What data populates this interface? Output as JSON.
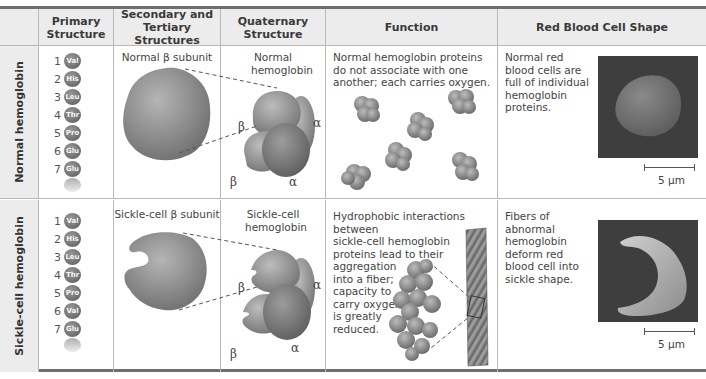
{
  "header": {
    "columns": [
      {
        "id": "row_label",
        "label": ""
      },
      {
        "id": "primary",
        "label": "Primary Structure"
      },
      {
        "id": "secondary_tertiary",
        "label": "Secondary and Tertiary Structures"
      },
      {
        "id": "quaternary",
        "label": "Quaternary Structure"
      },
      {
        "id": "function",
        "label": "Function"
      },
      {
        "id": "rbc_shape",
        "label": "Red Blood Cell Shape"
      }
    ]
  },
  "rows": [
    {
      "label": "Normal hemoglobin",
      "primary": {
        "residues": [
          {
            "n": "1",
            "aa": "Val"
          },
          {
            "n": "2",
            "aa": "His"
          },
          {
            "n": "3",
            "aa": "Leu"
          },
          {
            "n": "4",
            "aa": "Thr"
          },
          {
            "n": "5",
            "aa": "Pro"
          },
          {
            "n": "6",
            "aa": "Glu"
          },
          {
            "n": "7",
            "aa": "Glu"
          }
        ]
      },
      "secondary_caption": "Normal β subunit",
      "quaternary_caption": "Normal hemoglobin",
      "quaternary_labels": {
        "beta_top": "β",
        "alpha_right": "α",
        "beta_bottom": "β",
        "alpha_bottom": "α"
      },
      "function_text": "Normal hemoglobin proteins do not associate with one another; each carries oxygen.",
      "rbc_text": "Normal red blood cells are full of individual hemoglobin proteins.",
      "scale_label": "5 µm"
    },
    {
      "label": "Sickle-cell hemoglobin",
      "primary": {
        "residues": [
          {
            "n": "1",
            "aa": "Val"
          },
          {
            "n": "2",
            "aa": "His"
          },
          {
            "n": "3",
            "aa": "Leu"
          },
          {
            "n": "4",
            "aa": "Thr"
          },
          {
            "n": "5",
            "aa": "Pro"
          },
          {
            "n": "6",
            "aa": "Val"
          },
          {
            "n": "7",
            "aa": "Glu"
          }
        ]
      },
      "secondary_caption": "Sickle-cell β subunit",
      "quaternary_caption": "Sickle-cell hemoglobin",
      "quaternary_labels": {
        "beta_top": "β",
        "alpha_right": "α",
        "beta_bottom": "β",
        "alpha_bottom": "α"
      },
      "function_text_lines": [
        "Hydrophobic interactions between",
        "sickle-cell hemoglobin",
        "proteins lead to their",
        "aggregation",
        "into a fiber;",
        "capacity to",
        "carry oxygen",
        "is greatly",
        "reduced."
      ],
      "rbc_text": "Fibers of abnormal hemoglobin deform red blood cell into sickle shape.",
      "scale_label": "5 µm"
    }
  ],
  "colors": {
    "header_bg": "#ececec",
    "border": "#b8b8b8",
    "rule": "#6e6e6e",
    "protein_gray": "#8a8a8a",
    "micrograph_bg": "#3e3e3e"
  }
}
